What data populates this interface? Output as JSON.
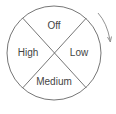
{
  "diagram": {
    "type": "rotary-dial",
    "segments": [
      {
        "position": "top",
        "label": "Off"
      },
      {
        "position": "right",
        "label": "Low"
      },
      {
        "position": "bottom",
        "label": "Medium"
      },
      {
        "position": "left",
        "label": "High"
      }
    ],
    "rotation_direction": "clockwise",
    "arrow_icon": "clockwise-arrow-icon"
  },
  "colors": {
    "stroke": "#555555",
    "text": "#444444",
    "background": "#ffffff"
  }
}
